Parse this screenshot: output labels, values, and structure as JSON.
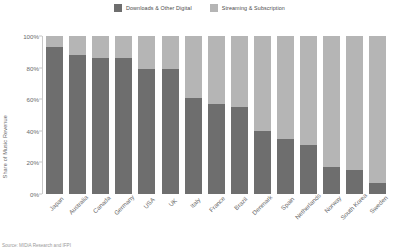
{
  "chart_data": {
    "type": "bar",
    "subtype": "stacked-bar-100-percent",
    "title": "",
    "xlabel": "",
    "ylabel": "Share of Music Revenue",
    "ylim": [
      0,
      100
    ],
    "ytick_labels": [
      "0%",
      "20%",
      "40%",
      "60%",
      "80%",
      "100%"
    ],
    "ytick_values": [
      0,
      20,
      40,
      60,
      80,
      100
    ],
    "grid": false,
    "legend_position": "top-center",
    "categories": [
      "Japan",
      "Australia",
      "Canada",
      "Germany",
      "USA",
      "UK",
      "Italy",
      "France",
      "Brazil",
      "Denmark",
      "Spain",
      "Netherlands",
      "Norway",
      "South Korea",
      "Sweden"
    ],
    "series": [
      {
        "name": "Downloads & Other Digital",
        "color": "#6e6e6e",
        "values": [
          93,
          88,
          86,
          86,
          79,
          79,
          61,
          57,
          55,
          40,
          35,
          31,
          17,
          15,
          7
        ]
      },
      {
        "name": "Streaming & Subscription",
        "color": "#b5b5b5",
        "values": [
          7,
          12,
          14,
          14,
          21,
          21,
          39,
          43,
          45,
          60,
          65,
          69,
          83,
          85,
          93
        ]
      }
    ],
    "source": "Source: MIDiA Research and IFPI"
  }
}
